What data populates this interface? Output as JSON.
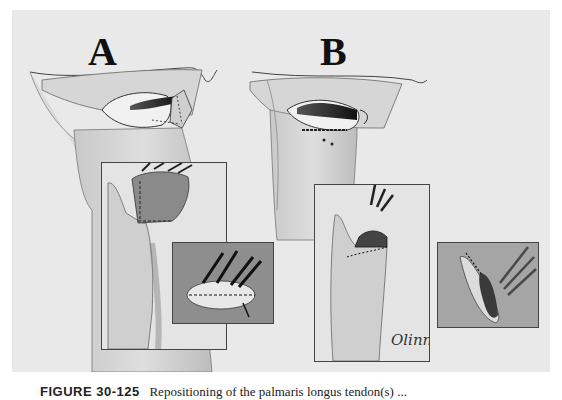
{
  "figure": {
    "panels": [
      {
        "id": "A",
        "label": "A"
      },
      {
        "id": "B",
        "label": "B"
      }
    ],
    "signature": "Olinn",
    "background_color": "#e9e9e9",
    "inset_dark_color": "#8e8e8e",
    "inset_light_color": "#dcdcdc"
  },
  "caption": {
    "figure_number": "FIGURE 30-125",
    "text": "Repositioning of the palmaris longus tendon(s) ..."
  }
}
